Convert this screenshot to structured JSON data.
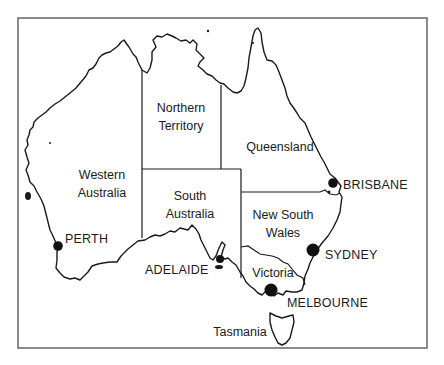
{
  "map": {
    "title": "Map of Australia",
    "colors": {
      "stroke": "#1a1a1a",
      "frame": "#666666",
      "land": "#ffffff",
      "city_dot": "#111111"
    },
    "states": [
      {
        "id": "wa",
        "line1": "Western",
        "line2": "Australia"
      },
      {
        "id": "nt",
        "line1": "Northern",
        "line2": "Territory"
      },
      {
        "id": "qld",
        "line1": "Queensland",
        "line2": ""
      },
      {
        "id": "sa",
        "line1": "South",
        "line2": "Australia"
      },
      {
        "id": "nsw",
        "line1": "New South",
        "line2": "Wales"
      },
      {
        "id": "vic",
        "line1": "Victoria",
        "line2": ""
      },
      {
        "id": "tas",
        "line1": "Tasmania",
        "line2": ""
      }
    ],
    "cities": [
      {
        "id": "perth",
        "name": "PERTH"
      },
      {
        "id": "adelaide",
        "name": "ADELAIDE"
      },
      {
        "id": "melbourne",
        "name": "MELBOURNE"
      },
      {
        "id": "sydney",
        "name": "SYDNEY"
      },
      {
        "id": "brisbane",
        "name": "BRISBANE"
      }
    ]
  }
}
